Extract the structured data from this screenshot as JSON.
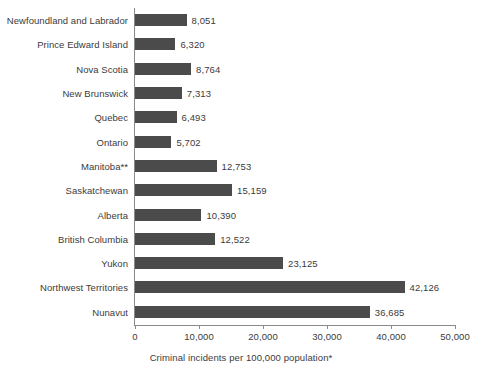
{
  "chart_data": {
    "type": "bar",
    "orientation": "horizontal",
    "title": "",
    "xlabel": "Criminal incidents per 100,000 population*",
    "ylabel": "",
    "xlim": [
      0,
      50000
    ],
    "xticks": [
      "0",
      "10,000",
      "20,000",
      "30,000",
      "40,000",
      "50,000"
    ],
    "xtick_values": [
      0,
      10000,
      20000,
      30000,
      40000,
      50000
    ],
    "grid": false,
    "legend": "none",
    "bar_color": "#4b4b4b",
    "categories": [
      "Newfoundland and Labrador",
      "Prince Edward Island",
      "Nova Scotia",
      "New Brunswick",
      "Quebec",
      "Ontario",
      "Manitoba**",
      "Saskatchewan",
      "Alberta",
      "British Columbia",
      "Yukon",
      "Northwest Territories",
      "Nunavut"
    ],
    "values": [
      8051,
      6320,
      8764,
      7313,
      6493,
      5702,
      12753,
      15159,
      10390,
      12522,
      23125,
      42126,
      36685
    ],
    "value_labels": [
      "8,051",
      "6,320",
      "8,764",
      "7,313",
      "6,493",
      "5,702",
      "12,753",
      "15,159",
      "10,390",
      "12,522",
      "23,125",
      "42,126",
      "36,685"
    ]
  }
}
